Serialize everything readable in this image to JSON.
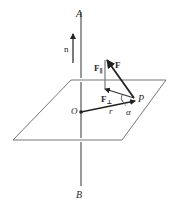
{
  "diagram": {
    "labels": {
      "axis_top": "A",
      "axis_bottom": "B",
      "origin": "O",
      "point": "P",
      "normal": "n",
      "force": "F",
      "force_parallel": "F",
      "force_parallel_sub": "∥",
      "force_perp": "F",
      "force_perp_sub": "⊥",
      "radius": "r",
      "angle": "α"
    },
    "colors": {
      "line": "#555555",
      "vector": "#222222",
      "text": "#2a2a2a"
    }
  }
}
